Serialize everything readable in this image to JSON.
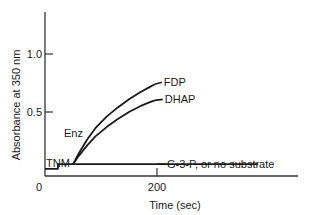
{
  "chart_data": {
    "type": "line",
    "title": "",
    "xlabel": "Time (sec)",
    "ylabel": "Absorbance at 350 nm",
    "xlim": [
      0,
      400
    ],
    "ylim": [
      0,
      1.35
    ],
    "grid": false,
    "x_ticks": [
      {
        "value": 0,
        "label": "0"
      },
      {
        "value": 200,
        "label": "200"
      }
    ],
    "y_ticks": [
      {
        "value": 0.5,
        "label": "0.5"
      },
      {
        "value": 1.0,
        "label": "1.0"
      }
    ],
    "series": [
      {
        "name": "FDP",
        "x": [
          50,
          60,
          75,
          90,
          110,
          130,
          150,
          170,
          185,
          196
        ],
        "y": [
          0.05,
          0.14,
          0.26,
          0.36,
          0.46,
          0.54,
          0.61,
          0.67,
          0.71,
          0.74
        ]
      },
      {
        "name": "DHAP",
        "x": [
          50,
          60,
          75,
          90,
          110,
          130,
          150,
          170,
          185,
          196
        ],
        "y": [
          0.05,
          0.12,
          0.21,
          0.29,
          0.37,
          0.44,
          0.5,
          0.55,
          0.58,
          0.6
        ]
      },
      {
        "name": "G-3-P, or no substrate",
        "x": [
          0,
          23,
          23,
          50,
          100,
          200,
          300,
          380
        ],
        "y": [
          0.01,
          0.01,
          0.05,
          0.05,
          0.05,
          0.05,
          0.05,
          0.05
        ]
      }
    ],
    "annotations": [
      {
        "text": "TNM",
        "x": 20,
        "y": 0.08,
        "meaning": "addition of TNM (step in baseline)"
      },
      {
        "text": "Enz",
        "x": 40,
        "y": 0.3,
        "meaning": "addition of enzyme"
      },
      {
        "text": "FDP",
        "series": "FDP"
      },
      {
        "text": "DHAP",
        "series": "DHAP"
      },
      {
        "text": "G-3-P, or no substrate",
        "series": "G-3-P, or no substrate"
      }
    ]
  }
}
